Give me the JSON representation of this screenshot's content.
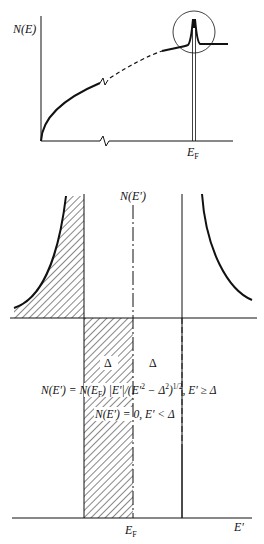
{
  "top_panel": {
    "y_axis_label": "N(E)",
    "x_tick_label_main": "E",
    "x_tick_label_sub": "F",
    "description": "Normal-metal density of states N(E) vs E with peak near Fermi energy (circled)"
  },
  "bottom_panel": {
    "y_axis_label": "N(E′)",
    "x_axis_label": "E′",
    "x_tick_label_main": "E",
    "x_tick_label_sub": "F",
    "gap_label_left": "Δ",
    "gap_label_right": "Δ",
    "formula_main": "N(E′) = N(E",
    "formula_sub": "F",
    "formula_rest": ") |E′|/(E′",
    "formula_sup1": "2",
    "formula_rest2": " − Δ",
    "formula_sup2": "2",
    "formula_rest3": ")",
    "formula_sup3": "1/2",
    "formula_tail": ", E′ ≥ Δ",
    "formula_zero": "N(E′) = 0, E′ < Δ",
    "description": "Superconducting density of states with gap 2Δ centered at E_F; occupied states hatched"
  },
  "colors": {
    "ink": "#111111",
    "background": "#ffffff"
  }
}
